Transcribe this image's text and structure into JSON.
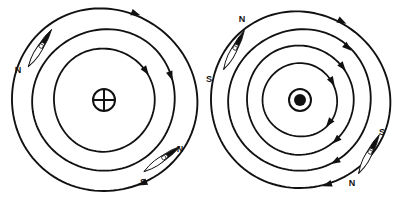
{
  "figure": {
    "background_color": "#ffffff",
    "line_color": "#111111",
    "width": 405,
    "height": 202
  },
  "panels": [
    {
      "id": "left-panel",
      "name": "current-into-page-panel",
      "center": {
        "x": 104,
        "y": 100
      },
      "conductor": {
        "symbol": "cross-in-circle",
        "meaning": "current-into-page",
        "radius": 11
      },
      "field_circles": [
        {
          "radius": 92,
          "arrows": [
            {
              "angle_deg": -70
            },
            {
              "angle_deg": 65
            }
          ]
        },
        {
          "radius": 71,
          "arrows": [
            {
              "angle_deg": -20
            }
          ]
        },
        {
          "radius": 51,
          "arrows": [
            {
              "angle_deg": -35
            }
          ]
        }
      ],
      "circulation": "clockwise",
      "compasses": [
        {
          "id": "left-upper-needle",
          "name": "compass-needle-upper-left",
          "pivot": {
            "x": 40,
            "y": 48
          },
          "angle_deg": 58,
          "length": 44,
          "width": 11,
          "labels": [
            {
              "pole": "N",
              "x": 18,
              "y": 73
            },
            {
              "pole": "",
              "x": 0,
              "y": 0
            }
          ]
        },
        {
          "id": "left-lower-needle",
          "name": "compass-needle-lower-right",
          "pivot": {
            "x": 162,
            "y": 159
          },
          "angle_deg": 35,
          "length": 44,
          "width": 11,
          "labels": [
            {
              "pole": "N",
              "x": 180,
              "y": 152
            },
            {
              "pole": "S",
              "x": 143,
              "y": 185
            }
          ]
        }
      ]
    },
    {
      "id": "right-panel",
      "name": "current-out-of-page-panel",
      "center": {
        "x": 300,
        "y": 100
      },
      "conductor": {
        "symbol": "dot-in-circle",
        "meaning": "current-out-of-page",
        "radius": 11,
        "inner_dot_radius": 6
      },
      "field_circles": [
        {
          "radius": 89,
          "arrows": [
            {
              "angle_deg": -62
            },
            {
              "angle_deg": 72
            }
          ]
        },
        {
          "radius": 71,
          "arrows": [
            {
              "angle_deg": -48
            },
            {
              "angle_deg": 60
            }
          ]
        },
        {
          "radius": 54,
          "arrows": [
            {
              "angle_deg": -38
            },
            {
              "angle_deg": 48
            }
          ]
        },
        {
          "radius": 37,
          "arrows": [
            {
              "angle_deg": -30
            },
            {
              "angle_deg": 38
            }
          ]
        }
      ],
      "circulation": "clockwise",
      "compasses": [
        {
          "id": "right-upper-needle",
          "name": "compass-needle-upper-left",
          "pivot": {
            "x": 234,
            "y": 50
          },
          "angle_deg": 62,
          "length": 44,
          "width": 11,
          "labels": [
            {
              "pole": "N",
              "x": 242,
              "y": 22
            },
            {
              "pole": "S",
              "x": 209,
              "y": 82
            }
          ]
        },
        {
          "id": "right-lower-needle",
          "name": "compass-needle-lower-right",
          "pivot": {
            "x": 369,
            "y": 154
          },
          "angle_deg": 62,
          "length": 44,
          "width": 11,
          "labels": [
            {
              "pole": "S",
              "x": 382,
              "y": 135
            },
            {
              "pole": "N",
              "x": 352,
              "y": 186
            }
          ]
        }
      ]
    }
  ],
  "labels": {
    "north": "N",
    "south": "S"
  }
}
